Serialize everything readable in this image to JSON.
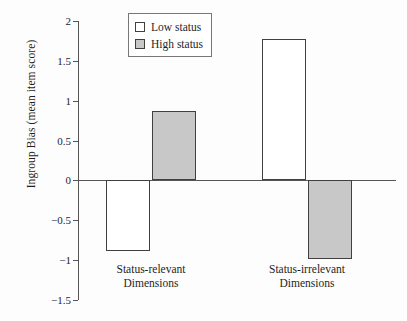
{
  "chart_data": {
    "type": "bar",
    "title": "",
    "subtitle": "",
    "xlabel": "",
    "ylabel": "Ingroup Bias (mean item score)",
    "categories": [
      "Status-relevant Dimensions",
      "Status-irrelevant Dimensions"
    ],
    "series": [
      {
        "name": "Low status",
        "values": [
          -0.89,
          1.78
        ],
        "fill": "#ffffff",
        "edge": "#404040"
      },
      {
        "name": "High status",
        "values": [
          0.87,
          -0.98
        ],
        "fill": "#c8c8c8",
        "edge": "#404040"
      }
    ],
    "ylim": [
      -1.5,
      2
    ],
    "yticks": [
      2,
      1.5,
      1,
      0.5,
      0,
      -0.5,
      -1,
      -1.5
    ],
    "ytick_labels": [
      "2",
      "1.5",
      "1",
      "0.5",
      "0",
      "−0.5",
      "−1",
      "−1.5"
    ],
    "grid": false,
    "legend_position": "top-center",
    "zero_line": 0
  },
  "axis": {
    "y_title": "Ingroup Bias (mean item score)",
    "ticks": [
      {
        "value": 2,
        "label": "2"
      },
      {
        "value": 1.5,
        "label": "1.5"
      },
      {
        "value": 1,
        "label": "1"
      },
      {
        "value": 0.5,
        "label": "0.5"
      },
      {
        "value": 0,
        "label": "0"
      },
      {
        "value": -0.5,
        "label": "−0.5"
      },
      {
        "value": -1,
        "label": "−1"
      },
      {
        "value": -1.5,
        "label": "−1.5"
      }
    ]
  },
  "categories": [
    {
      "line1": "Status-relevant",
      "line2": "Dimensions"
    },
    {
      "line1": "Status-irrelevant",
      "line2": "Dimensions"
    }
  ],
  "legend": {
    "items": [
      {
        "label": "Low status",
        "swatch": "white-square-icon"
      },
      {
        "label": "High status",
        "swatch": "gray-square-icon"
      }
    ]
  },
  "bars": [
    {
      "name": "status-relevant-low-status",
      "series": "Low status",
      "category": "Status-relevant Dimensions",
      "value": -0.89
    },
    {
      "name": "status-relevant-high-status",
      "series": "High status",
      "category": "Status-relevant Dimensions",
      "value": 0.87
    },
    {
      "name": "status-irrelevant-low-status",
      "series": "Low status",
      "category": "Status-irrelevant Dimensions",
      "value": 1.78
    },
    {
      "name": "status-irrelevant-high-status",
      "series": "High status",
      "category": "Status-irrelevant Dimensions",
      "value": -0.98
    }
  ]
}
